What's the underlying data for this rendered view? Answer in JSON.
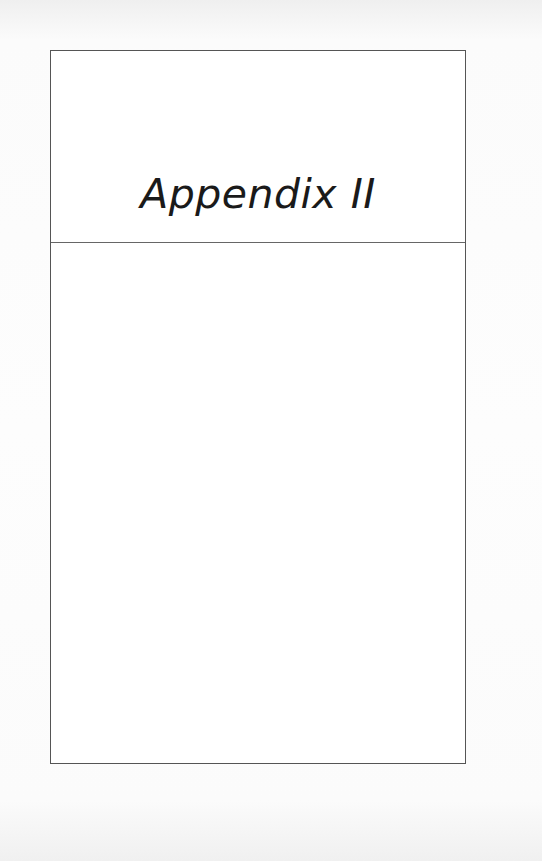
{
  "page": {
    "title": "Appendix II",
    "colors": {
      "background": "#f6f6f6",
      "frame_border": "#555555",
      "text": "#1a1a1a"
    }
  }
}
